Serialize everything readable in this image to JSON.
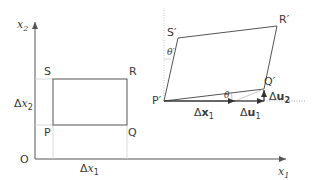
{
  "diagram": {
    "type": "deformation-diagram",
    "colors": {
      "line": "#555555",
      "guide": "#cccccc",
      "text": "#3a3a3a"
    },
    "axes": {
      "origin_label": "O",
      "x_axis": {
        "symbol": "x",
        "subscript": "1"
      },
      "y_axis": {
        "symbol": "x",
        "subscript": "2"
      }
    },
    "original_element": {
      "vertices": {
        "P": "P",
        "Q": "Q",
        "R": "R",
        "S": "S"
      },
      "width_label": {
        "delta": "Δ",
        "symbol": "x",
        "subscript": "1"
      },
      "height_label": {
        "delta": "Δ",
        "symbol": "x",
        "subscript": "2"
      }
    },
    "deformed_element": {
      "vertices": {
        "P": "P′",
        "Q": "Q′",
        "R": "R′",
        "S": "S′"
      },
      "angle_bottom": "θ",
      "angle_left": "θ′",
      "vectors": {
        "dx1": {
          "delta": "Δ",
          "symbol": "x",
          "subscript": "1"
        },
        "du1": {
          "delta": "Δ",
          "symbol": "u",
          "subscript": "1"
        },
        "du2": {
          "delta": "Δ",
          "symbol": "u",
          "subscript": "2"
        }
      }
    }
  }
}
